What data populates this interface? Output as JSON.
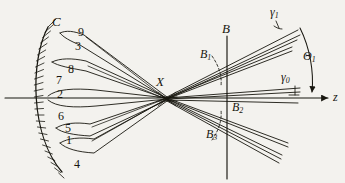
{
  "figure": {
    "kind": "optics-ray-diagram",
    "title": "",
    "background_color": "#f3f2ee",
    "ink_color": "#17160f",
    "width": 345,
    "height": 183
  },
  "labels": {
    "mirror": {
      "text": "C",
      "x": 52,
      "y": 15,
      "size": 13
    },
    "crossing": {
      "text": "X",
      "x": 156,
      "y": 75,
      "size": 13
    },
    "plane_b": {
      "text": "B",
      "x": 222,
      "y": 22,
      "size": 13
    },
    "b1": {
      "text": "B",
      "sub": "1",
      "x": 200,
      "y": 48,
      "size": 12
    },
    "b2": {
      "text": "B",
      "sub": "2",
      "x": 232,
      "y": 101,
      "size": 12
    },
    "b3": {
      "text": "B",
      "sub": "3",
      "x": 206,
      "y": 128,
      "size": 12
    },
    "gamma1": {
      "text": "γ",
      "sub": "1",
      "x": 270,
      "y": 6,
      "size": 12
    },
    "gamma0": {
      "text": "γ",
      "sub": "0",
      "x": 281,
      "y": 71,
      "size": 12
    },
    "theta1": {
      "text": "Θ",
      "sub": "1",
      "x": 303,
      "y": 50,
      "size": 12
    },
    "zaxis": {
      "text": "z",
      "x": 333,
      "y": 91,
      "size": 12
    }
  },
  "ray_numbers": [
    {
      "id": "9",
      "x": 78,
      "y": 26,
      "size": 12
    },
    {
      "id": "3",
      "x": 75,
      "y": 40,
      "size": 12
    },
    {
      "id": "8",
      "x": 68,
      "y": 63,
      "size": 12
    },
    {
      "id": "7",
      "x": 56,
      "y": 74,
      "size": 12
    },
    {
      "id": "2",
      "x": 57,
      "y": 88,
      "size": 12
    },
    {
      "id": "6",
      "x": 58,
      "y": 110,
      "size": 12
    },
    {
      "id": "5",
      "x": 65,
      "y": 122,
      "size": 12
    },
    {
      "id": "1",
      "x": 66,
      "y": 134,
      "size": 12
    },
    {
      "id": "4",
      "x": 74,
      "y": 158,
      "size": 12
    }
  ],
  "chart_data": {
    "type": "diagram",
    "axis": {
      "name": "z",
      "x_start": 5,
      "x_end": 330,
      "y": 98
    },
    "crossing_point": {
      "name": "X",
      "x": 167,
      "y": 99
    },
    "plane": {
      "name": "B",
      "x": 227,
      "y_top": 36,
      "y_bottom": 179
    },
    "plane_intersections": [
      {
        "name": "B1",
        "x": 227,
        "y": 62
      },
      {
        "name": "B2",
        "x": 227,
        "y": 98
      },
      {
        "name": "B3",
        "x": 227,
        "y": 134
      }
    ],
    "angles": [
      {
        "name": "γ₁",
        "description": "upper beam inclination mark"
      },
      {
        "name": "γ₀",
        "description": "axial beam inclination mark"
      },
      {
        "name": "Θ₁",
        "description": "arc from upper beam down to z axis"
      }
    ],
    "ray_labels": [
      "1",
      "2",
      "3",
      "4",
      "5",
      "6",
      "7",
      "8",
      "9"
    ]
  }
}
